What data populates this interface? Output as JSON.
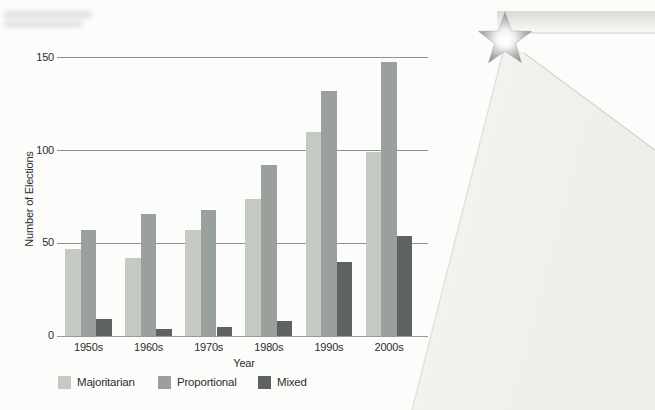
{
  "figure": {
    "background": "#fcfcfb"
  },
  "chart_data": {
    "type": "bar",
    "title": "",
    "categories": [
      "1950s",
      "1960s",
      "1970s",
      "1980s",
      "1990s",
      "2000s"
    ],
    "series": [
      {
        "name": "Majoritarian",
        "color": "#c5c9c4",
        "values": [
          47,
          42,
          57,
          74,
          110,
          99
        ]
      },
      {
        "name": "Proportional",
        "color": "#9aa09b",
        "values": [
          57,
          66,
          68,
          92,
          132,
          148
        ]
      },
      {
        "name": "Mixed",
        "color": "#5d6460",
        "values": [
          9,
          4,
          5,
          8,
          40,
          54
        ]
      }
    ],
    "xlabel": "Year",
    "ylabel": "Number of Elections",
    "ylim": [
      0,
      150
    ],
    "yticks": [
      0,
      50,
      100,
      150
    ],
    "grid": true,
    "gridline_color": "#8f8f8d",
    "axis_line_color": "#9a9a98",
    "text_color": "#2e2e2e",
    "legend_position": "bottom"
  },
  "decoration": {
    "name": "star-with-light-rays",
    "star_edge_color": "#7d7d7d",
    "ray_fill_color": "#f1f1ee",
    "band_top_color": "#d9d9d6"
  }
}
